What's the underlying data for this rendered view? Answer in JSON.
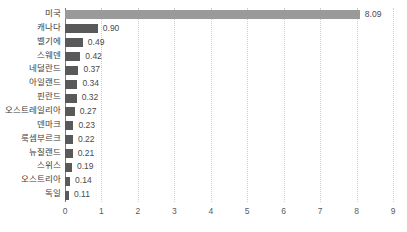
{
  "chart_data": {
    "type": "bar",
    "orientation": "horizontal",
    "title": "",
    "xlabel": "",
    "ylabel": "",
    "xlim": [
      0,
      9
    ],
    "xticks": [
      "0",
      "1",
      "2",
      "3",
      "4",
      "5",
      "6",
      "7",
      "8",
      "9"
    ],
    "grid": true,
    "legend": "none",
    "categories": [
      "미국",
      "캐나다",
      "벨기에",
      "스웨덴",
      "네덜란드",
      "아일랜드",
      "핀란드",
      "오스트레일리아",
      "덴마크",
      "룩셈부르크",
      "뉴질랜드",
      "스위스",
      "오스트리아",
      "독일"
    ],
    "values": [
      8.09,
      0.9,
      0.49,
      0.42,
      0.37,
      0.34,
      0.32,
      0.27,
      0.23,
      0.22,
      0.21,
      0.19,
      0.14,
      0.11
    ],
    "value_labels": [
      "8.09",
      "0.90",
      "0.49",
      "0.42",
      "0.37",
      "0.34",
      "0.32",
      "0.27",
      "0.23",
      "0.22",
      "0.21",
      "0.19",
      "0.14",
      "0.11"
    ],
    "highlight_index": 0,
    "colors": {
      "bar": "#595959",
      "bar_highlight": "#9a9a9a",
      "gridline": "#cfcfcf",
      "axis_line": "#7a7a7a",
      "label_text": "#3d3d3d",
      "tick_text": "#5a5a5a",
      "background": "#ffffff"
    }
  }
}
